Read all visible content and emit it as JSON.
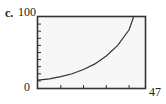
{
  "label": "c.",
  "chart_data": {
    "type": "line",
    "title": "",
    "xlabel": "",
    "ylabel": "",
    "xlim": [
      0,
      47
    ],
    "ylim": [
      0,
      100
    ],
    "x_tick_labels": {
      "min": "0",
      "max": "47"
    },
    "y_tick_labels": {
      "min": "0",
      "max": "100"
    },
    "x_ticks": [
      10,
      20,
      30,
      40
    ],
    "y_ticks": [
      10,
      20,
      30,
      40,
      50,
      60,
      70,
      80,
      90
    ],
    "grid": false,
    "series": [
      {
        "name": "curve",
        "x": [
          0,
          5,
          10,
          15,
          20,
          25,
          30,
          35,
          40,
          42
        ],
        "y": [
          11,
          13,
          16,
          20,
          26,
          34,
          45,
          60,
          82,
          100
        ]
      }
    ]
  }
}
